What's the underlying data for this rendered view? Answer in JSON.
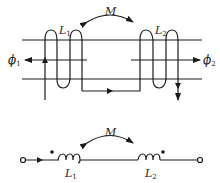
{
  "top_diagram": {
    "mutual_label": "M",
    "coil1_label": "L",
    "coil1_sub": "1",
    "coil2_label": "L",
    "coil2_sub": "2",
    "flux_left_label": "ϕ",
    "flux_left_sub": "1",
    "flux_right_label": "ϕ",
    "flux_right_sub": "2"
  },
  "bottom_diagram": {
    "mutual_label": "M",
    "coil1_label": "L",
    "coil1_sub": "1",
    "coil2_label": "L",
    "coil2_sub": "2"
  },
  "colors": {
    "stroke": "#1a1a1a",
    "background": "#ffffff"
  }
}
